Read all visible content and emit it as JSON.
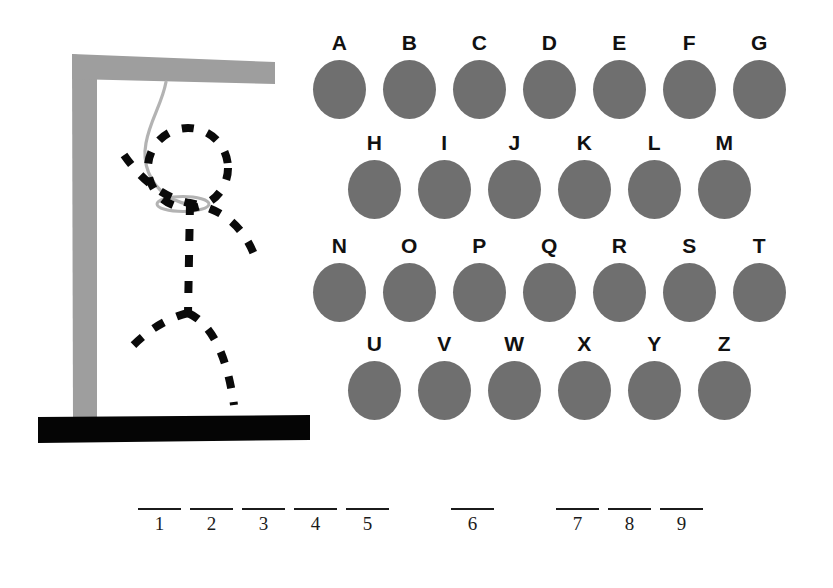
{
  "colors": {
    "background": "#ffffff",
    "key_disc": "#6f6f6f",
    "key_label": "#111111",
    "gallows_post": "#9e9e9e",
    "gallows_base": "#050505",
    "rope": "#b3b3b3",
    "figure": "#0a0a0a",
    "blank_line": "#1b1b1b"
  },
  "gallows": {
    "post_name": "gallows-post",
    "beam_name": "gallows-beam",
    "base_name": "gallows-base",
    "rope_name": "gallows-rope",
    "parts_drawn": [
      "head",
      "arms",
      "torso",
      "legs"
    ]
  },
  "keyboard": {
    "rows": [
      {
        "keys": [
          {
            "letter": "A",
            "used": false
          },
          {
            "letter": "B",
            "used": false
          },
          {
            "letter": "C",
            "used": false
          },
          {
            "letter": "D",
            "used": false
          },
          {
            "letter": "E",
            "used": false
          },
          {
            "letter": "F",
            "used": false
          },
          {
            "letter": "G",
            "used": false
          }
        ]
      },
      {
        "keys": [
          {
            "letter": "H",
            "used": false
          },
          {
            "letter": "I",
            "used": false
          },
          {
            "letter": "J",
            "used": false
          },
          {
            "letter": "K",
            "used": false
          },
          {
            "letter": "L",
            "used": false
          },
          {
            "letter": "M",
            "used": false
          }
        ]
      },
      {
        "keys": [
          {
            "letter": "N",
            "used": false
          },
          {
            "letter": "O",
            "used": false
          },
          {
            "letter": "P",
            "used": false
          },
          {
            "letter": "Q",
            "used": false
          },
          {
            "letter": "R",
            "used": false
          },
          {
            "letter": "S",
            "used": false
          },
          {
            "letter": "T",
            "used": false
          }
        ]
      },
      {
        "keys": [
          {
            "letter": "U",
            "used": false
          },
          {
            "letter": "V",
            "used": false
          },
          {
            "letter": "W",
            "used": false
          },
          {
            "letter": "X",
            "used": false
          },
          {
            "letter": "Y",
            "used": false
          },
          {
            "letter": "Z",
            "used": false
          }
        ]
      }
    ]
  },
  "answer": {
    "slots": [
      {
        "index": "1",
        "letter": "",
        "gap_after": false
      },
      {
        "index": "2",
        "letter": "",
        "gap_after": false
      },
      {
        "index": "3",
        "letter": "",
        "gap_after": false
      },
      {
        "index": "4",
        "letter": "",
        "gap_after": false
      },
      {
        "index": "5",
        "letter": "",
        "gap_after": true
      },
      {
        "index": "6",
        "letter": "",
        "gap_after": true
      },
      {
        "index": "7",
        "letter": "",
        "gap_after": false
      },
      {
        "index": "8",
        "letter": "",
        "gap_after": false
      },
      {
        "index": "9",
        "letter": "",
        "gap_after": false
      }
    ]
  }
}
